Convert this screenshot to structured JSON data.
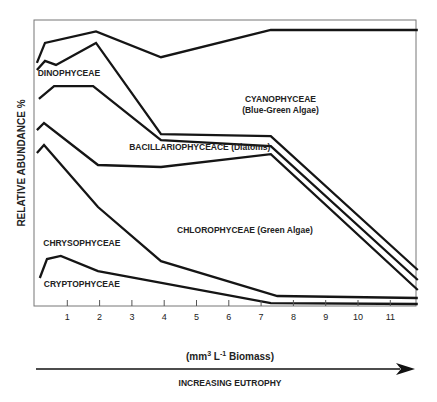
{
  "chart_data": {
    "type": "area",
    "title": "",
    "xlabel": "(mm3 L-1 Biomass)",
    "xlabel_parts": {
      "pre": "(mm",
      "sup1": "3",
      "mid": " L",
      "sup2": "-1",
      "post": " Biomass)"
    },
    "ylabel": "RELATIVE ABUNDANCE %",
    "arrow_label": "INCREASING EUTROPHY",
    "xlim": [
      0,
      11.9
    ],
    "ylim": [
      0,
      100
    ],
    "grid": false,
    "x_ticks": [
      1,
      2,
      3,
      4,
      5,
      6,
      7,
      8,
      9,
      10,
      11
    ],
    "x_tick_labels": [
      "1",
      "2",
      "3",
      "4",
      "5",
      "6",
      "7",
      "8",
      "9",
      "10",
      "11"
    ],
    "boundaries": [
      {
        "name": "top-boundary",
        "x": [
          0.06,
          0.31,
          1.89,
          3.9,
          7.3,
          11.85
        ],
        "y": [
          85,
          92,
          96,
          87,
          96.5,
          96.5
        ]
      },
      {
        "name": "cyanophyceae-lower",
        "x": [
          0.06,
          0.31,
          0.65,
          1.89,
          3.9,
          7.3,
          11.85
        ],
        "y": [
          82.5,
          85.7,
          84.3,
          92,
          60.1,
          59.4,
          12.6
        ]
      },
      {
        "name": "dinophyceae-lower",
        "x": [
          0.12,
          0.59,
          1.8,
          3.9,
          7.3,
          11.85
        ],
        "y": [
          72.4,
          76.9,
          76.9,
          58,
          55.9,
          9.1
        ]
      },
      {
        "name": "bacillariophyceae-lower",
        "x": [
          0.06,
          0.28,
          1.95,
          3.9,
          7.3,
          11.85
        ],
        "y": [
          61.5,
          64,
          49.3,
          48.6,
          53.1,
          5.6
        ]
      },
      {
        "name": "chlorophyceae-lower",
        "x": [
          0.06,
          0.28,
          1.95,
          3.9,
          7.5,
          11.85
        ],
        "y": [
          53.5,
          56.3,
          34.6,
          15.7,
          3.5,
          2.8
        ]
      },
      {
        "name": "chrysophyceae-lower",
        "x": [
          0.15,
          0.37,
          0.8,
          1.95,
          7.3,
          11.85
        ],
        "y": [
          9.8,
          16.4,
          17.5,
          12.2,
          1.0,
          0.7
        ]
      }
    ],
    "series_labels": [
      {
        "name": "dinophyceae",
        "text": "DINOPHYCEAE",
        "x": 1.05,
        "y": 80.5
      },
      {
        "name": "cyanophyceae",
        "text": "CYANOPHYCEAE",
        "x": 7.6,
        "y": 71.5
      },
      {
        "name": "cyanophyceae-sub",
        "text": "(Blue-Green Algae)",
        "x": 7.6,
        "y": 67.5
      },
      {
        "name": "bacillariophyceae",
        "text": "BACILLARIOPHYCEACE (Diatoms)",
        "x": 5.1,
        "y": 54.5
      },
      {
        "name": "chlorophyceae",
        "text": "CHLOROPHYCEAE (Green Algae)",
        "x": 6.5,
        "y": 25.5
      },
      {
        "name": "chrysophyceae",
        "text": "CHRYSOPHYCEAE",
        "x": 1.45,
        "y": 21.0
      },
      {
        "name": "cryptophyceae",
        "text": "CRYPTOPHYCEAE",
        "x": 1.45,
        "y": 6.5
      }
    ]
  }
}
